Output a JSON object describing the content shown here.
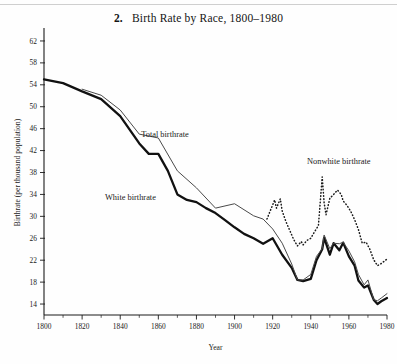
{
  "figure": {
    "number": "2.",
    "title": "Birth Rate by Race, 1800–1980"
  },
  "axes": {
    "x_title": "Year",
    "y_title": "Birthrate (per thousand population)"
  },
  "labels": {
    "total": "Total birthrate",
    "white": "White birthrate",
    "nonwhite": "Nonwhite birthrate"
  },
  "colors": {
    "white_line": "#111111",
    "total_line": "#4a4a4a",
    "nonwhite_line": "#1a1a1a",
    "axis": "#1a1a1a",
    "background": "#fefefe"
  },
  "chart_data": {
    "type": "line",
    "title": "Birth Rate by Race, 1800–1980",
    "xlabel": "Year",
    "ylabel": "Birthrate (per thousand population)",
    "xlim": [
      1800,
      1980
    ],
    "ylim": [
      12,
      64
    ],
    "grid": false,
    "legend": "inline-annotations",
    "xticks": [
      1800,
      1820,
      1840,
      1860,
      1880,
      1900,
      1920,
      1940,
      1960,
      1980
    ],
    "xticks_minor": [
      1810,
      1830,
      1850,
      1870,
      1890,
      1910,
      1930,
      1950,
      1970
    ],
    "yticks": [
      14,
      18,
      22,
      26,
      30,
      34,
      38,
      42,
      46,
      50,
      54,
      58,
      62
    ],
    "series": [
      {
        "name": "White birthrate",
        "style": "solid-thick",
        "x": [
          1800,
          1810,
          1820,
          1830,
          1840,
          1850,
          1855,
          1860,
          1865,
          1870,
          1875,
          1880,
          1885,
          1890,
          1895,
          1900,
          1905,
          1910,
          1915,
          1920,
          1925,
          1930,
          1933,
          1936,
          1940,
          1943,
          1946,
          1947,
          1950,
          1952,
          1955,
          1957,
          1960,
          1963,
          1965,
          1968,
          1970,
          1973,
          1975,
          1977,
          1980
        ],
        "y": [
          55.0,
          54.3,
          52.8,
          51.4,
          48.3,
          43.3,
          41.4,
          41.4,
          38.3,
          34.0,
          33.0,
          32.6,
          31.5,
          30.6,
          29.3,
          28.0,
          26.8,
          26.0,
          25.0,
          26.0,
          23.0,
          20.6,
          18.4,
          18.2,
          18.6,
          22.0,
          24.0,
          26.1,
          23.0,
          25.1,
          23.8,
          25.2,
          22.7,
          21.0,
          18.3,
          17.0,
          17.4,
          14.8,
          14.0,
          14.5,
          15.1
        ]
      },
      {
        "name": "Total birthrate",
        "style": "solid-thin",
        "x": [
          1820,
          1830,
          1840,
          1850,
          1860,
          1870,
          1880,
          1890,
          1900,
          1910,
          1915,
          1920,
          1925,
          1930,
          1933,
          1936,
          1940,
          1943,
          1946,
          1947,
          1950,
          1952,
          1955,
          1957,
          1960,
          1963,
          1965,
          1968,
          1970,
          1973,
          1975,
          1977,
          1980
        ],
        "y": [
          53.2,
          52.1,
          49.4,
          45.0,
          44.3,
          38.3,
          35.2,
          31.5,
          32.3,
          30.1,
          29.5,
          27.7,
          25.1,
          21.3,
          18.4,
          18.4,
          19.4,
          22.7,
          24.1,
          26.6,
          24.1,
          25.1,
          25.0,
          25.3,
          23.7,
          21.7,
          19.4,
          17.5,
          18.4,
          14.8,
          14.6,
          15.1,
          15.9
        ]
      },
      {
        "name": "Nonwhite birthrate",
        "style": "dotted",
        "x": [
          1917,
          1920,
          1921,
          1922,
          1924,
          1925,
          1927,
          1929,
          1931,
          1933,
          1935,
          1936,
          1938,
          1940,
          1942,
          1944,
          1946,
          1947,
          1948,
          1950,
          1952,
          1954,
          1956,
          1957,
          1959,
          1961,
          1963,
          1965,
          1967,
          1969,
          1971,
          1973,
          1975,
          1977,
          1980
        ],
        "y": [
          29.5,
          32.1,
          33.0,
          31.5,
          33.2,
          31.0,
          29.0,
          27.4,
          25.8,
          24.6,
          25.4,
          24.8,
          25.6,
          26.0,
          27.2,
          28.3,
          37.2,
          32.5,
          30.3,
          33.3,
          34.0,
          34.8,
          34.0,
          32.8,
          32.0,
          30.9,
          29.4,
          27.6,
          25.1,
          25.3,
          24.0,
          22.1,
          21.0,
          21.4,
          22.2
        ]
      }
    ],
    "annotations": [
      {
        "text": "Total birthrate",
        "x": 1851,
        "y": 44.5
      },
      {
        "text": "White birthrate",
        "x": 1832,
        "y": 33.0
      },
      {
        "text": "Nonwhite birthrate",
        "x": 1938,
        "y": 39.5
      }
    ]
  }
}
